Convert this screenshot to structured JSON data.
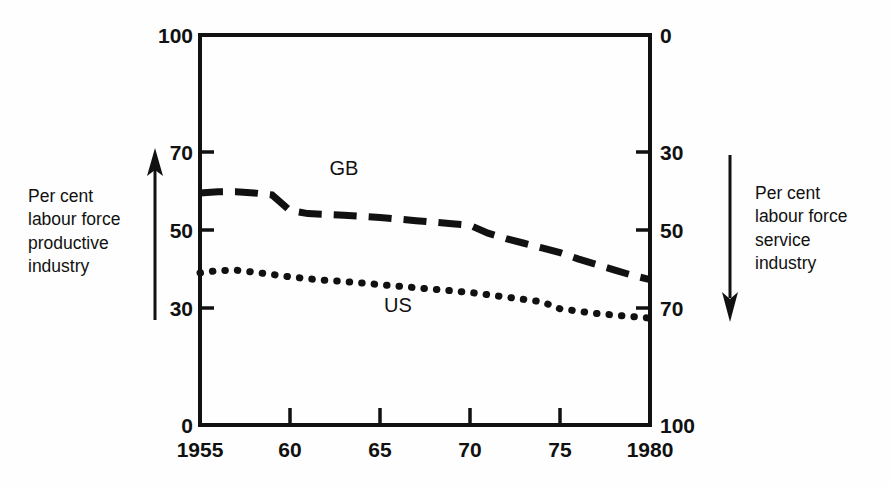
{
  "chart_data": {
    "type": "line",
    "title": "",
    "xlabel": "",
    "ylabel": "Per cent labour force productive industry",
    "ylabel_right": "Per cent labour force service industry",
    "x": [
      1955,
      1956,
      1957,
      1958,
      1959,
      1960,
      1961,
      1962,
      1963,
      1964,
      1965,
      1966,
      1967,
      1968,
      1969,
      1970,
      1971,
      1972,
      1973,
      1974,
      1975,
      1976,
      1977,
      1978,
      1979,
      1980
    ],
    "xlim": [
      1955,
      1980
    ],
    "ylim": [
      0,
      100
    ],
    "ylim_right": [
      100,
      0
    ],
    "y_ticks": [
      0,
      30,
      50,
      70,
      100
    ],
    "y_tick_labels": [
      "0",
      "30",
      "50",
      "70",
      "100"
    ],
    "y_ticks_right": [
      0,
      30,
      50,
      70,
      100
    ],
    "y_tick_labels_right": [
      "0",
      "30",
      "50",
      "70",
      "100"
    ],
    "x_ticks": [
      1955,
      1960,
      1965,
      1970,
      1975,
      1980
    ],
    "x_tick_labels": [
      "1955",
      "60",
      "65",
      "70",
      "75",
      "1980"
    ],
    "grid": false,
    "legend": "inline-labels",
    "series": [
      {
        "name": "GB",
        "style": "dashed",
        "label_position": {
          "x": 1963,
          "y": 64
        },
        "values": [
          59.5,
          59.8,
          59.8,
          59.5,
          59.0,
          55.0,
          54.2,
          54.0,
          53.8,
          53.5,
          53.2,
          52.8,
          52.4,
          52.0,
          51.6,
          51.2,
          49.2,
          47.8,
          46.6,
          45.4,
          44.2,
          42.6,
          41.2,
          39.8,
          38.4,
          37.3
        ]
      },
      {
        "name": "US",
        "style": "dotted",
        "label_position": {
          "x": 1966,
          "y": 29
        },
        "values": [
          39.0,
          39.6,
          39.7,
          39.2,
          38.6,
          38.0,
          37.5,
          37.1,
          36.8,
          36.4,
          36.0,
          35.6,
          35.2,
          34.8,
          34.4,
          34.0,
          33.4,
          32.8,
          32.2,
          31.6,
          29.8,
          29.2,
          28.6,
          28.2,
          27.8,
          27.4
        ]
      }
    ],
    "annotations": []
  },
  "axes": {
    "left_caption": "Per cent\nlabour force\nproductive\nindustry",
    "right_caption": "Per cent\nlabour force\nservice\nindustry",
    "left_arrow_direction": "up",
    "right_arrow_direction": "down"
  },
  "colors": {
    "ink": "#111111",
    "background": "#fefefe"
  }
}
